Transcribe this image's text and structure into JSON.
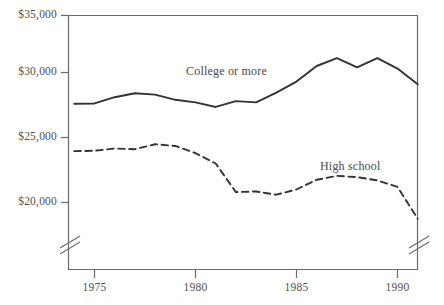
{
  "chart_data": {
    "type": "line",
    "title": "",
    "subtitle": "",
    "xlabel": "",
    "ylabel": "",
    "xlim": [
      1974,
      1991.5
    ],
    "ylim": [
      18000,
      35000
    ],
    "y_axis_break": true,
    "grid": false,
    "legend_position": "inline-annotations",
    "x_ticks": [
      1975,
      1980,
      1985,
      1990
    ],
    "x_tick_labels": [
      "1975",
      "1980",
      "1985",
      "1990"
    ],
    "y_ticks": [
      20000,
      25000,
      30000,
      35000
    ],
    "y_tick_labels": [
      "$20,000",
      "$25,000",
      "$30,000",
      "$35,000"
    ],
    "x": [
      1974,
      1975,
      1976,
      1977,
      1978,
      1979,
      1980,
      1981,
      1982,
      1983,
      1984,
      1985,
      1986,
      1987,
      1988,
      1989,
      1990,
      1991
    ],
    "series": [
      {
        "name": "College or more",
        "style": "solid",
        "color": "#333333",
        "label_x": 1980.4,
        "label_y": 30950,
        "values": [
          27600,
          27620,
          28100,
          28400,
          28300,
          27900,
          27700,
          27350,
          27800,
          27700,
          28450,
          29300,
          30500,
          31100,
          30400,
          31100,
          30300,
          29100
        ]
      },
      {
        "name": "High school",
        "style": "dashed",
        "color": "#333333",
        "label_x": 1987.3,
        "label_y": 23050,
        "values": [
          23950,
          23980,
          24150,
          24100,
          24480,
          24350,
          23800,
          23000,
          20800,
          20850,
          20600,
          21000,
          21750,
          22050,
          21950,
          21700,
          21200,
          18750
        ]
      }
    ],
    "annotations": [
      {
        "text": "College or more"
      },
      {
        "text": "High school"
      }
    ]
  },
  "axis": {
    "y_labels": [
      "$35,000",
      "$30,000",
      "$25,000",
      "$20,000"
    ],
    "x_labels": [
      "1975",
      "1980",
      "1985",
      "1990"
    ]
  },
  "labels": {
    "college": "College or more",
    "highschool": "High school"
  }
}
